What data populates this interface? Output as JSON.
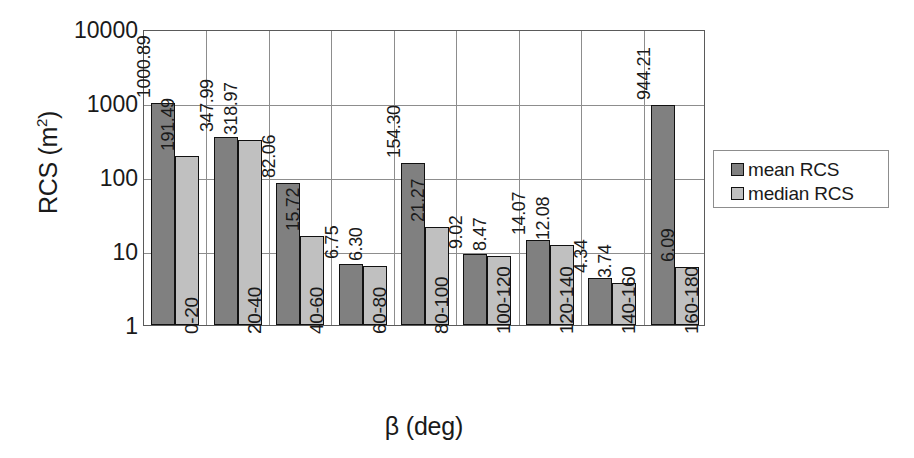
{
  "chart_data": {
    "type": "bar",
    "title": "",
    "xlabel": "β (deg)",
    "ylabel": "RCS (m²)",
    "ylabel_base": "RCS (m",
    "ylabel_sup": "2",
    "ylabel_tail": ")",
    "yscale": "log",
    "ylim": [
      1,
      10000
    ],
    "ytick_labels": [
      "10000",
      "1000",
      "100",
      "10",
      "1"
    ],
    "ytick_values": [
      10000,
      1000,
      100,
      10,
      1
    ],
    "grid": true,
    "legend_position": "right",
    "categories": [
      "0-20",
      "20-40",
      "40-60",
      "60-80",
      "80-100",
      "100-120",
      "120-140",
      "140-160",
      "160-180"
    ],
    "series": [
      {
        "name": "mean RCS",
        "color": "#808080",
        "values": [
          1000.89,
          347.99,
          82.06,
          6.75,
          154.3,
          9.02,
          14.07,
          4.34,
          944.21
        ],
        "labels": [
          "1000.89",
          "347.99",
          "82.06",
          "6.75",
          "154.30",
          "9.02",
          "14.07",
          "4.34",
          "944.21"
        ]
      },
      {
        "name": "median RCS",
        "color": "#c0c0c0",
        "values": [
          191.49,
          318.97,
          15.72,
          6.3,
          21.27,
          8.47,
          12.08,
          3.74,
          6.09
        ],
        "labels": [
          "191.49",
          "318.97",
          "15.72",
          "6.30",
          "21.27",
          "8.47",
          "12.08",
          "3.74",
          "6.09"
        ]
      }
    ]
  },
  "legend": {
    "items": [
      {
        "label": "mean RCS",
        "color": "#808080"
      },
      {
        "label": "median RCS",
        "color": "#c0c0c0"
      }
    ]
  }
}
